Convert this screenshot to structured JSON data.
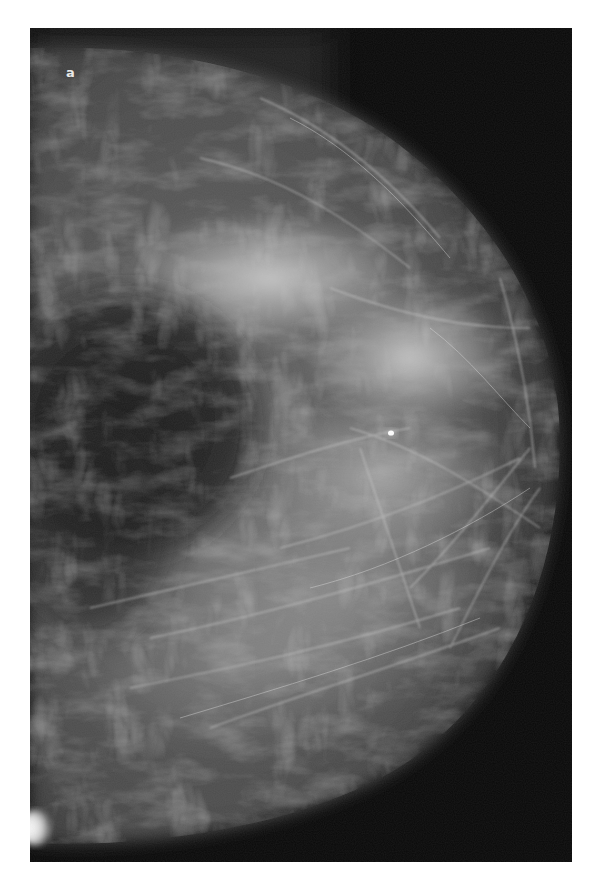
{
  "figure": {
    "panel_label": "a",
    "type": "mammogram",
    "colors": {
      "background_border": "#ffffff",
      "film_background": "#080808",
      "fatty_region": "#1c1c1c",
      "dense_tissue": "#c8c8c8",
      "calcification": "#ffffff"
    }
  }
}
